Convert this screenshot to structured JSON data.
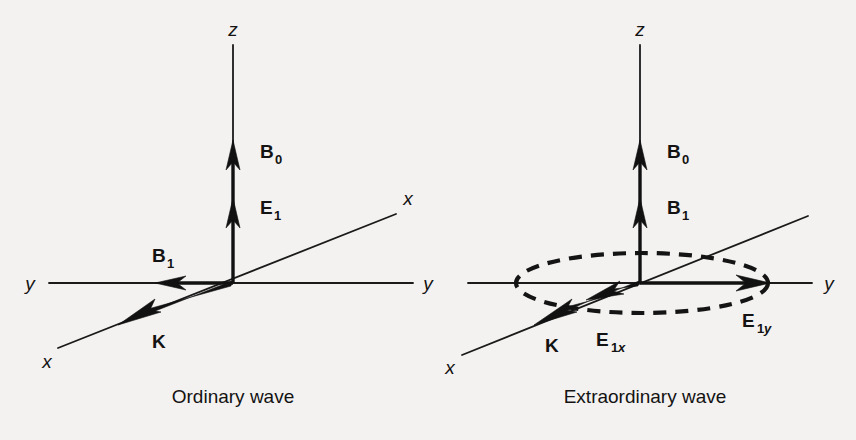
{
  "figure": {
    "background_color": "#f3f2f0",
    "ink_color": "#131313",
    "panels": [
      {
        "id": "ordinary",
        "caption": "Ordinary wave",
        "axes": [
          {
            "name": "z-axis",
            "label": "z"
          },
          {
            "name": "y-axis-left",
            "label": "y"
          },
          {
            "name": "y-axis-right",
            "label": "y"
          },
          {
            "name": "x-axis-near",
            "label": "x"
          },
          {
            "name": "x-axis-far",
            "label": "x"
          }
        ],
        "vectors": [
          {
            "name": "B0",
            "base": "B",
            "sub": "0",
            "sub_style": "upright",
            "direction": "up-along-z"
          },
          {
            "name": "E1",
            "base": "E",
            "sub": "1",
            "sub_style": "upright",
            "direction": "up-along-z"
          },
          {
            "name": "B1",
            "base": "B",
            "sub": "1",
            "sub_style": "upright",
            "direction": "left-along-y"
          },
          {
            "name": "K",
            "base": "K",
            "sub": "",
            "sub_style": "none",
            "direction": "down-left-along-x"
          }
        ]
      },
      {
        "id": "extraordinary",
        "caption": "Extraordinary wave",
        "axes": [
          {
            "name": "z-axis",
            "label": "z"
          },
          {
            "name": "y-axis-left",
            "label": ""
          },
          {
            "name": "y-axis-right",
            "label": "y"
          },
          {
            "name": "x-axis-near",
            "label": "x"
          },
          {
            "name": "x-axis-far",
            "label": ""
          }
        ],
        "vectors": [
          {
            "name": "B0",
            "base": "B",
            "sub": "0",
            "sub_style": "upright",
            "direction": "up-along-z"
          },
          {
            "name": "B1",
            "base": "B",
            "sub": "1",
            "sub_style": "upright",
            "direction": "up-along-z"
          },
          {
            "name": "E1y",
            "base": "E",
            "sub": "1",
            "sub2": "y",
            "sub_style": "italic-tail",
            "direction": "right-along-y"
          },
          {
            "name": "E1x",
            "base": "E",
            "sub": "1",
            "sub2": "x",
            "sub_style": "italic-tail",
            "direction": "down-left-along-x"
          },
          {
            "name": "K",
            "base": "K",
            "sub": "",
            "sub_style": "none",
            "direction": "down-left-along-x"
          }
        ],
        "polarization_ellipse": {
          "name": "polarization-ellipse",
          "style": "dashed"
        }
      }
    ],
    "labels": {
      "z": "z",
      "y": "y",
      "x": "x",
      "B": "B",
      "E": "E",
      "K": "K",
      "sub0": "0",
      "sub1": "1",
      "subx": "x",
      "suby": "y",
      "caption_left": "Ordinary wave",
      "caption_right": "Extraordinary wave"
    }
  }
}
